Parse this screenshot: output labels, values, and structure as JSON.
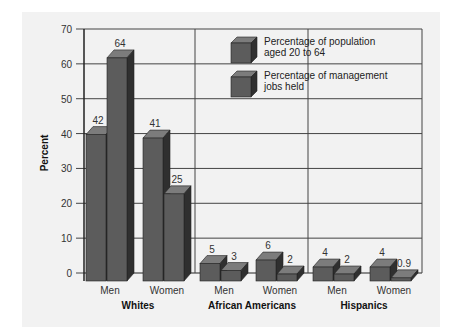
{
  "chart_data": {
    "type": "bar",
    "style": "3d-grouped",
    "title": "",
    "xlabel": "",
    "ylabel": "Percent",
    "ylim": [
      0,
      70
    ],
    "yticks": [
      0,
      10,
      20,
      30,
      40,
      50,
      60,
      70
    ],
    "grid": true,
    "legend_position": "top-center-inside",
    "groups": [
      "Whites",
      "African Americans",
      "Hispanics"
    ],
    "categories": [
      "Men",
      "Women",
      "Men",
      "Women",
      "Men",
      "Women"
    ],
    "category_groups": [
      "Whites",
      "Whites",
      "African Americans",
      "African Americans",
      "Hispanics",
      "Hispanics"
    ],
    "series": [
      {
        "name": "Percentage of population aged 20 to 64",
        "values": [
          42,
          41,
          5,
          6,
          4,
          4
        ]
      },
      {
        "name": "Percentage of management jobs held",
        "values": [
          64,
          25,
          3,
          2,
          2,
          0.9
        ]
      }
    ],
    "value_labels": [
      [
        "42",
        "41",
        "5",
        "6",
        "4",
        "4"
      ],
      [
        "64",
        "25",
        "3",
        "2",
        "2",
        "0.9"
      ]
    ]
  },
  "legend": {
    "items": [
      {
        "line1": "Percentage of population",
        "line2": "aged 20 to 64"
      },
      {
        "line1": "Percentage of management",
        "line2": "jobs held"
      }
    ]
  },
  "colors": {
    "bar_front": "#5c5c5c",
    "bar_top": "#7c7c7c",
    "bar_side": "#2f2f2f",
    "grid": "#444444",
    "panel": "#f2f2f2"
  }
}
